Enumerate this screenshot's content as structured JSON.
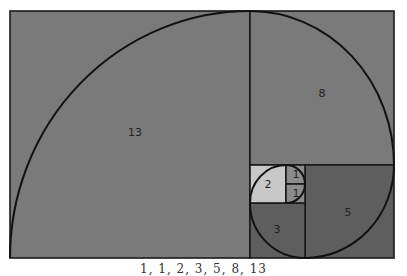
{
  "diagram": {
    "caption": "1, 1, 2, 3, 5, 8, 13",
    "squares": [
      {
        "label": "13",
        "x": 10,
        "y": 11,
        "w": 240,
        "h": 247,
        "fill": "#7a7a7a",
        "lx": 135,
        "ly": 133
      },
      {
        "label": "8",
        "x": 250,
        "y": 11,
        "w": 144,
        "h": 154,
        "fill": "#7a7a7a",
        "lx": 322,
        "ly": 94
      },
      {
        "label": "5",
        "x": 305,
        "y": 165,
        "w": 89,
        "h": 93,
        "fill": "#5e5e5e",
        "lx": 348,
        "ly": 213
      },
      {
        "label": "3",
        "x": 250,
        "y": 203,
        "w": 55,
        "h": 55,
        "fill": "#5e5e5e",
        "lx": 277,
        "ly": 230
      },
      {
        "label": "2",
        "x": 250,
        "y": 165,
        "w": 36,
        "h": 38,
        "fill": "#c8c8c8",
        "lx": 268,
        "ly": 185
      },
      {
        "label": "1",
        "x": 286,
        "y": 165,
        "w": 19,
        "h": 19,
        "fill": "#8c8c8c",
        "lx": 296,
        "ly": 175
      },
      {
        "label": "1",
        "x": 286,
        "y": 184,
        "w": 19,
        "h": 19,
        "fill": "#8c8c8c",
        "lx": 296,
        "ly": 194
      }
    ],
    "colors": {
      "large": "#7a7a7a",
      "dark": "#5e5e5e",
      "light": "#c8c8c8",
      "unit": "#8c8c8c",
      "stroke": "#111111"
    }
  }
}
